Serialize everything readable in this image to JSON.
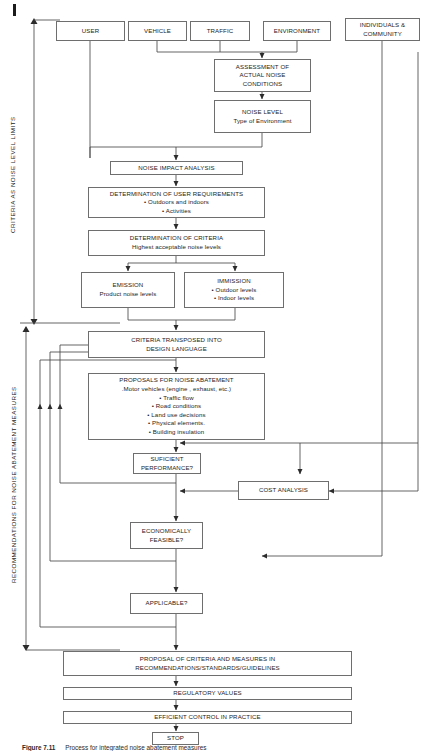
{
  "figure": {
    "caption_label": "Figure 7.11",
    "caption_text": "Process for integrated noise abatement measures"
  },
  "side_labels": {
    "upper": "CRITERIA AS NOISE LEVEL LIMITS",
    "lower": "RECOMMENDATIONS FOR NOISE ABATEMENT MEASURES"
  },
  "nodes": {
    "user": {
      "title": "USER"
    },
    "vehicle": {
      "title": "VEHICLE"
    },
    "traffic": {
      "title": "TRAFFIC"
    },
    "environment": {
      "title": "ENVIRONMENT"
    },
    "individuals": {
      "line1": "INDIVIDUALS &",
      "line2": "COMMUNITY"
    },
    "assessment": {
      "line1": "ASSESSMENT OF",
      "line2": "ACTUAL NOISE",
      "line3": "CONDITIONS"
    },
    "noise_level": {
      "title": "NOISE LEVEL",
      "sub": "Type of Environment"
    },
    "impact": {
      "title": "NOISE IMPACT ANALYSIS"
    },
    "user_req": {
      "title": "DETERMINATION OF USER REQUIREMENTS",
      "items": [
        "• Outdoors and indoors",
        "• Activities"
      ]
    },
    "criteria": {
      "title": "DETERMINATION OF CRITERIA",
      "sub": "Highest acceptable noise levels"
    },
    "emission": {
      "title": "EMISSION",
      "sub": "Product noise levels"
    },
    "immission": {
      "title": "IMMISSION",
      "items": [
        "• Outdoor levels",
        "• Indoor levels"
      ]
    },
    "transposed": {
      "line1": "CRITERIA TRANSPOSED INTO",
      "line2": "DESIGN LANGUAGE"
    },
    "proposals": {
      "title": "PROPOSALS FOR NOISE ABATEMENT",
      "items": [
        ".Motor vehicles (engine , exhaust, etc.)",
        "• Traffic flow",
        "• Road conditions",
        "• Land use decisions",
        "• Physical elements.",
        "• Building insulation"
      ]
    },
    "sufficient": {
      "line1": "SUFICIENT",
      "line2": "PERFORMANCE?"
    },
    "cost": {
      "title": "COST ANALYSIS"
    },
    "economically": {
      "line1": "ECONOMICALLY",
      "line2": "FEASIBLE?"
    },
    "applicable": {
      "title": "APPLICABLE?"
    },
    "proposal_final": {
      "line1": "PROPOSAL OF CRITERIA AND MEASURES IN",
      "line2": "RECOMMENDATIONS/STANDARDS/GUIDELINES"
    },
    "regulatory": {
      "title": "REGULATORY VALUES"
    },
    "efficient": {
      "title": "EFFICIENT CONTROL IN PRACTICE"
    },
    "stop": {
      "title": "STOP"
    }
  },
  "colors": {
    "stroke": "#6e6e6e",
    "line": "#4a4a4a",
    "text": "#1b1b1b",
    "background": "#ffffff"
  }
}
